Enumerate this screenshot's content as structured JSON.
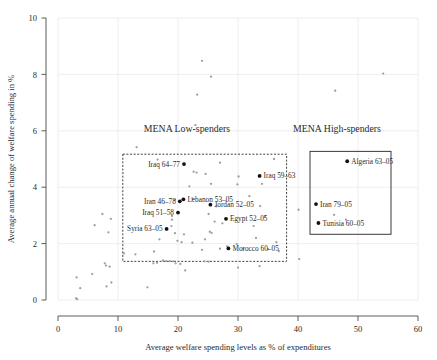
{
  "chart_data": {
    "type": "scatter",
    "title": "",
    "xlabel": "Average welfare spending levels as % of expenditures",
    "ylabel": "Average annual change of welfare spending in %",
    "xlim": [
      0,
      60
    ],
    "ylim": [
      0,
      10
    ],
    "xticks": [
      0,
      10,
      20,
      30,
      40,
      50,
      60
    ],
    "yticks": [
      0,
      2,
      4,
      6,
      8,
      10
    ],
    "grid": true,
    "legend": "none",
    "annotations": [
      {
        "text": "MENA Low-spenders",
        "x": 21.5,
        "y": 5.95
      },
      {
        "text": "MENA High-spenders",
        "x": 46.5,
        "y": 5.95
      }
    ],
    "regions": [
      {
        "name": "MENA Low-spenders",
        "style": "dashed",
        "x0": 10.8,
        "x1": 38.1,
        "y0": 1.37,
        "y1": 5.17
      },
      {
        "name": "MENA High-spenders",
        "style": "solid",
        "x0": 42.0,
        "x1": 55.5,
        "y0": 2.33,
        "y1": 5.27
      }
    ],
    "labeled_points": [
      {
        "label": "Iraq 64-77",
        "x": 21.0,
        "y": 4.82
      },
      {
        "label": "Iraq 59-63",
        "x": 33.6,
        "y": 4.4
      },
      {
        "label": "Lebanon 53-05",
        "x": 20.9,
        "y": 3.57
      },
      {
        "label": "Iran 46-78",
        "x": 20.3,
        "y": 3.5
      },
      {
        "label": "Jordan 52-05",
        "x": 25.4,
        "y": 3.38
      },
      {
        "label": "Iraq 51-58",
        "x": 20.0,
        "y": 3.1
      },
      {
        "label": "Egypt 52-05",
        "x": 28.0,
        "y": 2.88
      },
      {
        "label": "Syria 63-05",
        "x": 18.1,
        "y": 2.52
      },
      {
        "label": "Morocco 60-05",
        "x": 28.4,
        "y": 1.83
      },
      {
        "label": "Algeria 63-05",
        "x": 48.2,
        "y": 4.92
      },
      {
        "label": "Iran 79-05",
        "x": 43.0,
        "y": 3.4
      },
      {
        "label": "Tunisia 60-05",
        "x": 43.4,
        "y": 2.73
      }
    ],
    "points": [
      [
        24.0,
        8.48
      ],
      [
        54.2,
        8.03
      ],
      [
        25.5,
        7.92
      ],
      [
        46.2,
        7.42
      ],
      [
        23.2,
        7.28
      ],
      [
        22.9,
        6.2
      ],
      [
        13.1,
        5.42
      ],
      [
        36.0,
        5.0
      ],
      [
        16.6,
        4.98
      ],
      [
        27.0,
        4.87
      ],
      [
        22.6,
        4.55
      ],
      [
        23.1,
        4.52
      ],
      [
        24.6,
        4.47
      ],
      [
        10.8,
        4.5
      ],
      [
        30.1,
        4.38
      ],
      [
        34.0,
        4.12
      ],
      [
        25.5,
        4.12
      ],
      [
        29.9,
        4.1
      ],
      [
        21.9,
        4.03
      ],
      [
        31.9,
        3.68
      ],
      [
        22.4,
        3.6
      ],
      [
        19.5,
        3.55
      ],
      [
        33.7,
        3.33
      ],
      [
        26.4,
        3.32
      ],
      [
        46.0,
        3.02
      ],
      [
        25.1,
        3.05
      ],
      [
        19.0,
        2.98
      ],
      [
        34.5,
        2.95
      ],
      [
        40.1,
        3.2
      ],
      [
        7.4,
        3.05
      ],
      [
        8.8,
        2.88
      ],
      [
        6.1,
        2.65
      ],
      [
        48.0,
        2.85
      ],
      [
        19.0,
        2.85
      ],
      [
        26.1,
        2.78
      ],
      [
        27.4,
        2.72
      ],
      [
        18.9,
        2.62
      ],
      [
        32.6,
        2.62
      ],
      [
        19.5,
        2.37
      ],
      [
        21.0,
        2.33
      ],
      [
        8.4,
        2.4
      ],
      [
        25.3,
        2.42
      ],
      [
        25.6,
        2.38
      ],
      [
        16.9,
        2.15
      ],
      [
        19.9,
        2.1
      ],
      [
        20.6,
        2.05
      ],
      [
        22.4,
        2.03
      ],
      [
        33.0,
        2.2
      ],
      [
        36.4,
        2.05
      ],
      [
        24.5,
        2.15
      ],
      [
        29.8,
        1.98
      ],
      [
        28.2,
        1.9
      ],
      [
        27.0,
        1.82
      ],
      [
        24.0,
        1.78
      ],
      [
        30.9,
        1.82
      ],
      [
        35.0,
        1.8
      ],
      [
        12.9,
        1.62
      ],
      [
        11.0,
        1.65
      ],
      [
        16.0,
        1.72
      ],
      [
        36.8,
        1.73
      ],
      [
        40.2,
        1.45
      ],
      [
        17.5,
        1.4
      ],
      [
        18.0,
        1.38
      ],
      [
        18.6,
        1.38
      ],
      [
        19.2,
        1.37
      ],
      [
        24.4,
        1.37
      ],
      [
        25.1,
        1.36
      ],
      [
        15.9,
        1.3
      ],
      [
        16.5,
        1.32
      ],
      [
        19.6,
        1.3
      ],
      [
        20.4,
        1.28
      ],
      [
        30.0,
        1.15
      ],
      [
        33.6,
        1.2
      ],
      [
        21.2,
        1.05
      ],
      [
        7.8,
        1.3
      ],
      [
        8.0,
        1.22
      ],
      [
        8.6,
        1.18
      ],
      [
        8.9,
        0.62
      ],
      [
        8.1,
        0.48
      ],
      [
        5.7,
        0.92
      ],
      [
        3.1,
        0.8
      ],
      [
        3.7,
        0.42
      ],
      [
        3.0,
        0.06
      ],
      [
        14.9,
        0.45
      ],
      [
        3.2,
        0.03
      ]
    ]
  },
  "axis": {
    "x_tick_labels": [
      "0",
      "10",
      "20",
      "30",
      "40",
      "50",
      "60"
    ],
    "y_tick_labels": [
      "0",
      "2",
      "4",
      "6",
      "8",
      "10"
    ]
  }
}
